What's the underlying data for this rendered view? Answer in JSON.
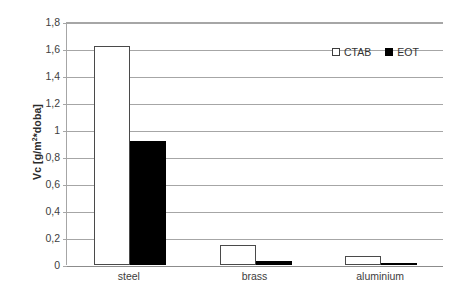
{
  "chart_data": {
    "type": "bar",
    "title": "",
    "subtitle": "",
    "xlabel": "",
    "ylabel": "Vc [g/m2*doba]",
    "ylabel_prefix": "Vc [g/m",
    "ylabel_superscript": "2",
    "ylabel_suffix": "*doba]",
    "categories": [
      "steel",
      "brass",
      "aluminium"
    ],
    "series": [
      {
        "name": "CTAB",
        "values": [
          1.62,
          0.15,
          0.07
        ],
        "color": "#ffffff",
        "border_color": "#4a4a4a",
        "swatch": "open"
      },
      {
        "name": "EOT",
        "values": [
          0.92,
          0.03,
          0.005
        ],
        "color": "#000000",
        "border_color": "#000000",
        "swatch": "filled"
      }
    ],
    "ylim": [
      0,
      1.8
    ],
    "ytick_values": [
      0,
      0.2,
      0.4,
      0.6,
      0.8,
      1,
      1.2,
      1.4,
      1.6,
      1.8
    ],
    "ytick_labels": [
      "0",
      "0,2",
      "0,4",
      "0,6",
      "0,8",
      "1",
      "1,2",
      "1,4",
      "1,6",
      "1,8"
    ],
    "grid": "horizontal",
    "legend_position": "top-right-inside",
    "decimal_separator": ",",
    "plot_background": "#ffffff",
    "grid_color": "#a6a6a6",
    "axis_color": "#8c8c8c"
  }
}
